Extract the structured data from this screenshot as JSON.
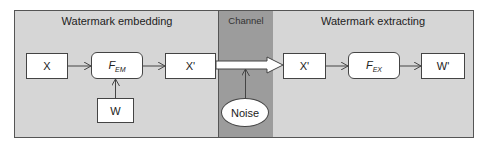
{
  "regions": {
    "embedding": {
      "title": "Watermark embedding"
    },
    "channel": {
      "title": "Channel"
    },
    "extracting": {
      "title": "Watermark extracting"
    }
  },
  "nodes": {
    "x": {
      "label": "X"
    },
    "f_em": {
      "label": "F",
      "sub": "EM"
    },
    "x_prime": {
      "label": "X'"
    },
    "w": {
      "label": "W"
    },
    "noise": {
      "label": "Noise"
    },
    "x_prime_recv": {
      "label": "X'"
    },
    "f_ex": {
      "label": "F",
      "sub": "EX"
    },
    "w_prime": {
      "label": "W'"
    }
  },
  "colors": {
    "region_fill": "#d6d6d6",
    "channel_fill": "#9c9c9c",
    "node_fill": "#ffffff",
    "stroke": "#444444"
  }
}
